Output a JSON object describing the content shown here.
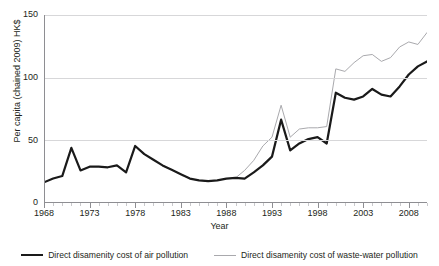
{
  "figure": {
    "title_fragment": "",
    "background": "#ffffff"
  },
  "axes": {
    "y_title": "Per capita (chained 2009) HK$",
    "x_title": "Year",
    "y_ticks": [
      "0",
      "50",
      "100",
      "150"
    ],
    "x_ticks": [
      "1968",
      "1973",
      "1978",
      "1983",
      "1988",
      "1993",
      "1998",
      "2003",
      "2008"
    ]
  },
  "legend": {
    "items": [
      {
        "label": "Direct disamenity cost of air pollution",
        "color": "#1a1a1a",
        "icon": "line-swatch-thick"
      },
      {
        "label": "Direct disamenity cost of waste-water pollution",
        "color": "#a9a9ad",
        "icon": "line-swatch-thin"
      }
    ]
  },
  "chart_data": {
    "type": "line",
    "title": "",
    "xlabel": "Year",
    "ylabel": "Per capita (chained 2009) HK$",
    "xlim": [
      1968,
      2010
    ],
    "ylim": [
      0,
      150
    ],
    "yticks": [
      0,
      50,
      100,
      150
    ],
    "xticks": [
      1968,
      1973,
      1978,
      1983,
      1988,
      1993,
      1998,
      2003,
      2008
    ],
    "grid": "horizontal",
    "legend_position": "bottom",
    "x": [
      1968,
      1969,
      1970,
      1971,
      1972,
      1973,
      1974,
      1975,
      1976,
      1977,
      1978,
      1979,
      1980,
      1981,
      1982,
      1983,
      1984,
      1985,
      1986,
      1987,
      1988,
      1989,
      1990,
      1991,
      1992,
      1993,
      1994,
      1995,
      1996,
      1997,
      1998,
      1999,
      2000,
      2001,
      2002,
      2003,
      2004,
      2005,
      2006,
      2007,
      2008,
      2009,
      2010
    ],
    "series": [
      {
        "name": "Direct disamenity cost of air pollution",
        "color": "#1a1a1a",
        "width": 2.2,
        "values": [
          16.5,
          19.5,
          21.5,
          44.0,
          26.0,
          29.0,
          29.0,
          28.5,
          30.0,
          24.5,
          45.5,
          39.0,
          34.5,
          30.0,
          26.5,
          23.0,
          19.5,
          18.0,
          17.5,
          18.0,
          19.5,
          20.0,
          19.5,
          24.5,
          30.0,
          37.0,
          66.5,
          42.0,
          47.5,
          51.0,
          52.5,
          47.5,
          88.0,
          84.0,
          82.5,
          85.0,
          91.0,
          86.5,
          85.0,
          93.0,
          102.5,
          109.0,
          113.0
        ]
      },
      {
        "name": "Direct disamenity cost of waste-water pollution",
        "color": "#a9a9ad",
        "width": 1.0,
        "values": [
          null,
          null,
          null,
          null,
          null,
          null,
          null,
          null,
          null,
          null,
          null,
          null,
          null,
          null,
          null,
          null,
          null,
          null,
          null,
          null,
          null,
          20.0,
          26.0,
          34.0,
          45.5,
          52.5,
          78.0,
          52.5,
          59.0,
          60.0,
          60.0,
          61.0,
          107.0,
          105.0,
          112.0,
          117.5,
          118.5,
          113.0,
          116.0,
          124.5,
          128.5,
          126.5,
          136.0
        ]
      }
    ]
  }
}
